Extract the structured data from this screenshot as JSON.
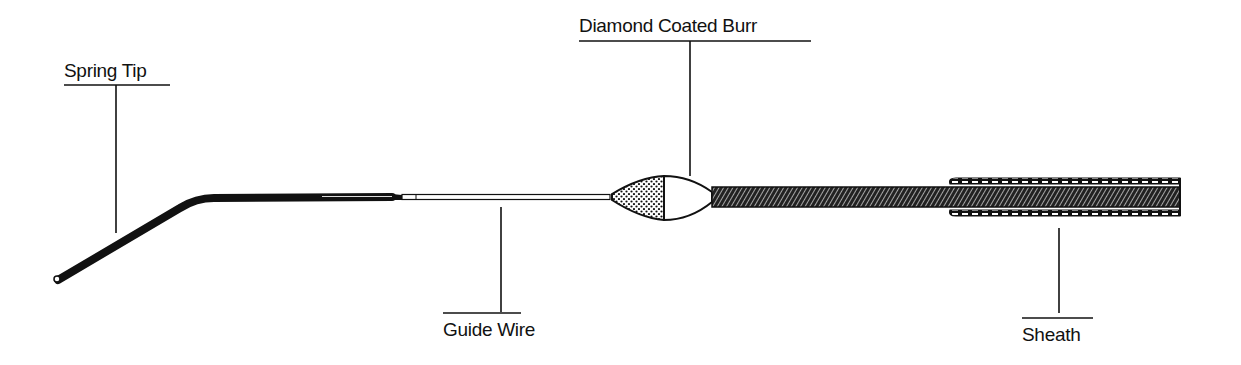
{
  "diagram": {
    "type": "labeled device illustration",
    "labels": {
      "spring_tip": "Spring Tip",
      "diamond_coated_burr": "Diamond Coated Burr",
      "guide_wire": "Guide Wire",
      "sheath": "Sheath"
    },
    "colors": {
      "ink": "#111111",
      "background": "#ffffff"
    }
  }
}
